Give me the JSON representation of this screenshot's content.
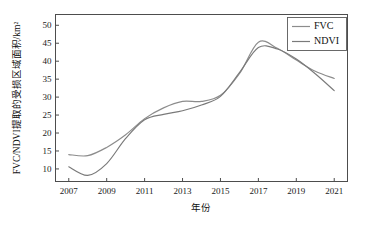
{
  "chart_data": {
    "type": "line",
    "title": "",
    "xlabel": "年份",
    "ylabel": "FVC/NDVI提取的受损区域面积/km²",
    "xlim": [
      2006.3,
      2021.7
    ],
    "ylim": [
      6.5,
      53.0
    ],
    "grid": false,
    "legend_position": "top-right",
    "xticks": [
      "2007",
      "2009",
      "2011",
      "2013",
      "2015",
      "2017",
      "2019",
      "2021"
    ],
    "xtick_values": [
      2007,
      2009,
      2011,
      2013,
      2015,
      2017,
      2019,
      2021
    ],
    "yticks": [
      "10",
      "15",
      "20",
      "25",
      "30",
      "35",
      "40",
      "45",
      "50"
    ],
    "ytick_values": [
      10,
      15,
      20,
      25,
      30,
      35,
      40,
      45,
      50
    ],
    "x": [
      2007,
      2008,
      2009,
      2010,
      2011,
      2012,
      2013,
      2014,
      2015,
      2016,
      2017,
      2018,
      2019,
      2020,
      2021
    ],
    "series": [
      {
        "name": "FVC",
        "color": "#8c8c8c",
        "values": [
          14.0,
          13.7,
          16.0,
          19.5,
          24.0,
          27.0,
          28.8,
          28.8,
          30.5,
          36.5,
          45.3,
          43.6,
          40.3,
          37.2,
          35.2
        ]
      },
      {
        "name": "NDVI",
        "color": "#7a7a7a",
        "values": [
          10.6,
          8.2,
          11.5,
          18.5,
          23.7,
          25.2,
          26.2,
          27.8,
          30.2,
          36.8,
          43.8,
          43.4,
          40.6,
          36.5,
          31.8
        ]
      }
    ]
  },
  "legend": {
    "entries": [
      {
        "label": "FVC"
      },
      {
        "label": "NDVI"
      }
    ]
  },
  "axes": {
    "x_title": "年份",
    "y_title": "FVC/NDVI提取的受损区域面积/km²"
  }
}
